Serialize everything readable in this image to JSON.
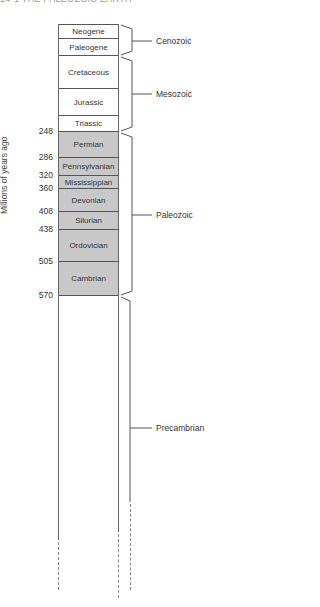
{
  "header": {
    "text": "14-1  THE PALEOZOIC EARTH"
  },
  "axis": {
    "ylabel": "Millions of years ago"
  },
  "periods": [
    {
      "name": "Neogene",
      "top": 0,
      "height": 14,
      "shaded": false
    },
    {
      "name": "Paleogene",
      "top": 14,
      "height": 17,
      "shaded": false
    },
    {
      "name": "Cretaceous",
      "top": 31,
      "height": 33,
      "shaded": false
    },
    {
      "name": "Jurassic",
      "top": 64,
      "height": 27,
      "shaded": false
    },
    {
      "name": "Triassic",
      "top": 91,
      "height": 16,
      "shaded": false
    },
    {
      "name": "Permian",
      "top": 107,
      "height": 26,
      "shaded": true
    },
    {
      "name": "Pennsylvanian",
      "top": 133,
      "height": 18,
      "shaded": true
    },
    {
      "name": "Mississippian",
      "top": 151,
      "height": 13,
      "shaded": true
    },
    {
      "name": "Devonian",
      "top": 164,
      "height": 23,
      "shaded": true
    },
    {
      "name": "Silurian",
      "top": 187,
      "height": 18,
      "shaded": true
    },
    {
      "name": "Ordovician",
      "top": 205,
      "height": 32,
      "shaded": true
    },
    {
      "name": "Cambrian",
      "top": 237,
      "height": 34,
      "shaded": true
    },
    {
      "name": "",
      "top": 271,
      "height": 249,
      "shaded": false
    }
  ],
  "ages": [
    {
      "value": "248",
      "y": 131
    },
    {
      "value": "286",
      "y": 157
    },
    {
      "value": "320",
      "y": 175
    },
    {
      "value": "360",
      "y": 188
    },
    {
      "value": "408",
      "y": 211
    },
    {
      "value": "438",
      "y": 229
    },
    {
      "value": "505",
      "y": 261
    },
    {
      "value": "570",
      "y": 295
    }
  ],
  "eras": [
    {
      "name": "Cenozoic",
      "y": 41
    },
    {
      "name": "Mesozoic",
      "y": 94
    },
    {
      "name": "Paleozoic",
      "y": 215
    },
    {
      "name": "Precambrian",
      "y": 428
    }
  ],
  "colors": {
    "shaded_fill": "#c8c8c8",
    "line": "#555555"
  }
}
